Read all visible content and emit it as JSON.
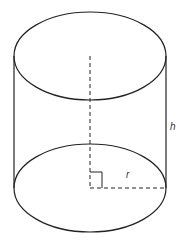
{
  "diagram": {
    "type": "cylinder",
    "labels": {
      "height": "h",
      "radius": "r"
    },
    "colors": {
      "stroke": "#222222",
      "background": "#ffffff",
      "label": "#333333"
    },
    "geometry": {
      "top_center": [
        90,
        56
      ],
      "bottom_center": [
        90,
        188
      ],
      "rx": 76,
      "ry": 44
    }
  }
}
